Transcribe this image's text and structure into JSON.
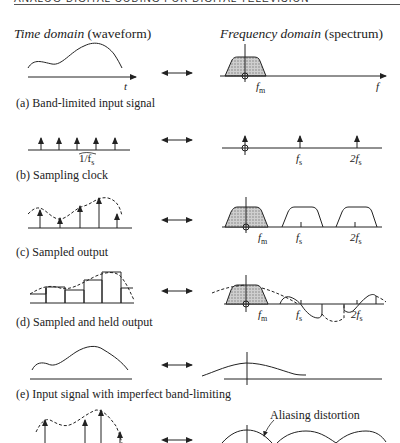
{
  "running_head": "ANALOG-DIGITAL CODING FOR DIGITAL TELEVISION",
  "headers": {
    "time_italic": "Time domain",
    "time_paren": " (waveform)",
    "freq_italic": "Frequency domain",
    "freq_paren": " (spectrum)"
  },
  "panels": [
    {
      "id": "a",
      "caption": "(a) Band-limited input signal"
    },
    {
      "id": "b",
      "caption": "(b) Sampling clock"
    },
    {
      "id": "c",
      "caption": "(c) Sampled output"
    },
    {
      "id": "d",
      "caption": "(d) Sampled and held output"
    },
    {
      "id": "e",
      "caption": "(e) Input signal with imperfect band-limiting"
    },
    {
      "id": "f",
      "caption": ""
    }
  ],
  "labels": {
    "t": "t",
    "f": "f",
    "fm": "f",
    "fm_sub": "m",
    "fs": "f",
    "fs_sub": "s",
    "two_fs": "2f",
    "two_fs_sub": "s",
    "period": "1/f",
    "period_sub": "s"
  },
  "annotation": "Aliasing distortion",
  "colors": {
    "ink": "#222222",
    "shade": "#9a9a9a",
    "background": "#ffffff"
  }
}
